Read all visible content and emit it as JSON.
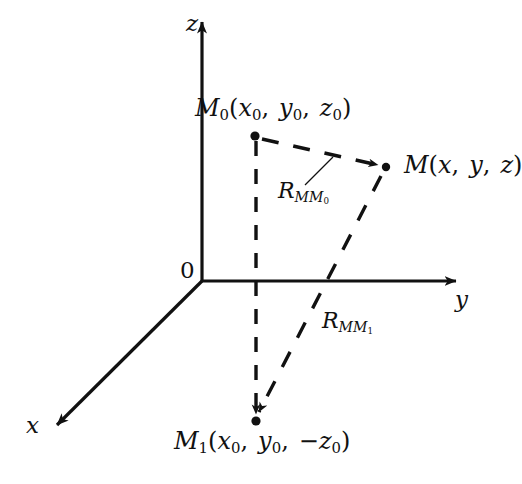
{
  "figure": {
    "kind": "3d-coordinate-axes-diagram",
    "background_color": "#ffffff",
    "stroke_color": "#111111",
    "axes": {
      "origin_label": "0",
      "z_label": "z",
      "y_label": "y",
      "x_label": "x"
    },
    "points": [
      {
        "id": "M0",
        "name_main": "M",
        "name_sub": "0",
        "coords_text": "(x₀, y₀, z₀)",
        "base": "M",
        "subscript": "0",
        "c1": "x",
        "c1sub": "0",
        "c2": "y",
        "c2sub": "0",
        "c3": "z",
        "c3sub": "0",
        "c3sign": ""
      },
      {
        "id": "M",
        "name_main": "M",
        "name_sub": "",
        "coords_text": "(x, y, z)",
        "base": "M",
        "subscript": "",
        "c1": "x",
        "c1sub": "",
        "c2": "y",
        "c2sub": "",
        "c3": "z",
        "c3sub": "",
        "c3sign": ""
      },
      {
        "id": "M1",
        "name_main": "M",
        "name_sub": "1",
        "coords_text": "(x₀, y₀, −z₀)",
        "base": "M",
        "subscript": "1",
        "c1": "x",
        "c1sub": "0",
        "c2": "y",
        "c2sub": "0",
        "c3": "z",
        "c3sub": "0",
        "c3sign": "−"
      }
    ],
    "distances": [
      {
        "id": "R_MM0",
        "base": "R",
        "subscript_main": "MM",
        "subscript_sub": "0",
        "text": "R_MM₀"
      },
      {
        "id": "R_MM1",
        "base": "R",
        "subscript_main": "MM",
        "subscript_sub": "1",
        "text": "R_MM₁"
      }
    ],
    "punctuation": {
      "open_paren": "(",
      "close_paren": ")",
      "comma": ",",
      "minus": "−"
    }
  }
}
